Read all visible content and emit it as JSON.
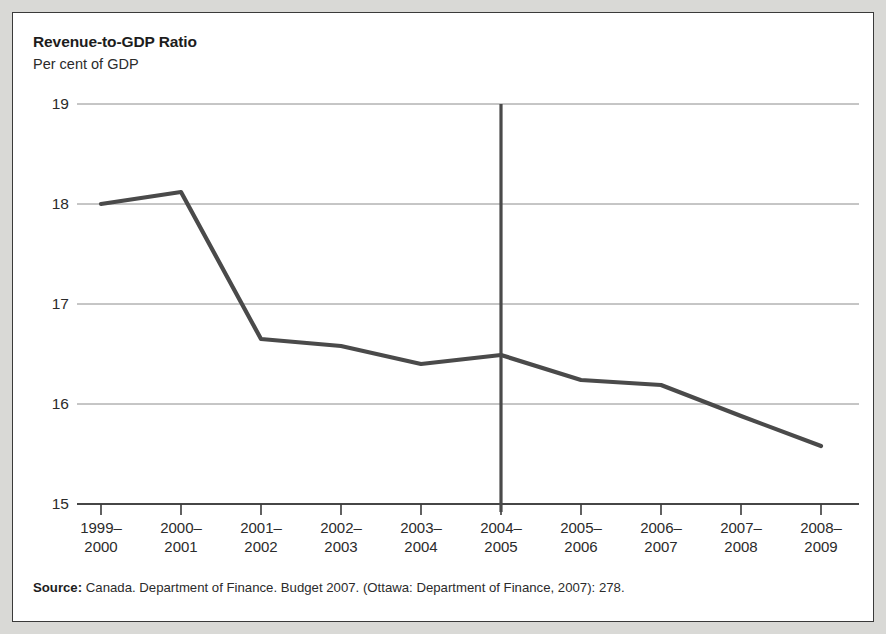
{
  "figure": {
    "title": "Revenue-to-GDP Ratio",
    "subtitle": "Per cent of GDP",
    "source_label": "Source:",
    "source_text": "Canada. Department of Finance. Budget 2007. (Ottawa: Department of Finance, 2007): 278.",
    "colors": {
      "line": "#4a4a4a",
      "gridline": "#8c8c8c",
      "axis": "#3a3a3a",
      "divider": "#4a4a4a",
      "card_background": "#ffffff",
      "page_background": "#d9d9d6",
      "text": "#2b2b2b"
    }
  },
  "chart_data": {
    "type": "line",
    "title": "Revenue-to-GDP Ratio",
    "subtitle": "Per cent of GDP",
    "xlabel": "",
    "ylabel": "Per cent of GDP",
    "categories": [
      "1999–2000",
      "2000–2001",
      "2001–2002",
      "2002–2003",
      "2003–2004",
      "2004–2005",
      "2005–2006",
      "2006–2007",
      "2007–2008",
      "2008–2009"
    ],
    "category_lines": [
      [
        "1999–",
        "2000"
      ],
      [
        "2000–",
        "2001"
      ],
      [
        "2001–",
        "2002"
      ],
      [
        "2002–",
        "2003"
      ],
      [
        "2003–",
        "2004"
      ],
      [
        "2004–",
        "2005"
      ],
      [
        "2005–",
        "2006"
      ],
      [
        "2006–",
        "2007"
      ],
      [
        "2007–",
        "2008"
      ],
      [
        "2008–",
        "2009"
      ]
    ],
    "values": [
      18.0,
      18.12,
      16.65,
      16.58,
      16.4,
      16.49,
      16.24,
      16.19,
      15.88,
      15.58
    ],
    "ylim": [
      15,
      19
    ],
    "yticks": [
      19,
      18,
      17,
      16,
      15
    ],
    "ytick_labels": [
      "19",
      "18",
      "17",
      "16",
      "15"
    ],
    "grid": true,
    "legend": "none",
    "annotations": [
      {
        "type": "vertical-divider",
        "at_category": "2004–2005",
        "description": "Vertical rule separating actual from projected years"
      }
    ]
  }
}
